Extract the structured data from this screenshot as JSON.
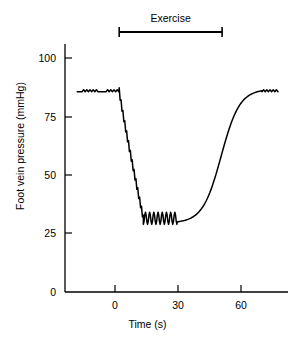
{
  "chart_data": {
    "type": "line",
    "title": "",
    "xlabel": "Time (s)",
    "ylabel": "Foot vein pressure (mmHg)",
    "xlim": [
      -18,
      78
    ],
    "ylim": [
      0,
      108
    ],
    "xticks": [
      0,
      30,
      60
    ],
    "xtick_labels": [
      "0",
      "30",
      "60"
    ],
    "yticks": [
      0,
      25,
      50,
      75,
      100
    ],
    "ytick_labels": [
      "0",
      "25",
      "50",
      "75",
      "100"
    ],
    "grid": false,
    "legend": null,
    "annotations": [
      {
        "name": "exercise-bar",
        "label": "Exercise",
        "x_start": 2,
        "x_end": 51,
        "y_value": 108
      }
    ],
    "series": [
      {
        "name": "Foot vein pressure",
        "color": "#000000",
        "baseline_pressure": 86,
        "nadir_pressure": 30,
        "recovery_pressure": 86,
        "x": [
          -18,
          -16,
          -14,
          -12,
          -10,
          -8,
          -6,
          -4,
          -2,
          0,
          1,
          2,
          3,
          4,
          5,
          6,
          7,
          8,
          9,
          10,
          11,
          12,
          13,
          14,
          15,
          16,
          17,
          18,
          19,
          20,
          21,
          22,
          23,
          24,
          25,
          26,
          27,
          28,
          29,
          30,
          32,
          34,
          36,
          38,
          40,
          42,
          45,
          48,
          51,
          54,
          57,
          60,
          63,
          66,
          68,
          70,
          72,
          74,
          76,
          78
        ],
        "y": [
          86,
          86,
          86,
          86,
          86,
          86,
          86,
          86,
          86,
          86,
          86,
          85,
          84,
          80,
          77,
          72,
          66,
          60,
          54,
          48,
          42,
          37,
          33,
          31,
          30,
          33,
          29,
          33,
          29,
          33,
          29,
          33,
          29,
          33,
          29,
          33,
          29,
          33,
          30,
          30,
          30,
          30,
          31,
          32,
          34,
          37,
          42,
          48,
          54,
          60,
          66,
          71,
          76,
          81,
          84,
          86,
          86,
          86,
          86,
          86
        ]
      }
    ]
  },
  "axes": {
    "y_axis_color": "#000000",
    "x_axis_color": "#000000",
    "trace_color": "#000000"
  }
}
